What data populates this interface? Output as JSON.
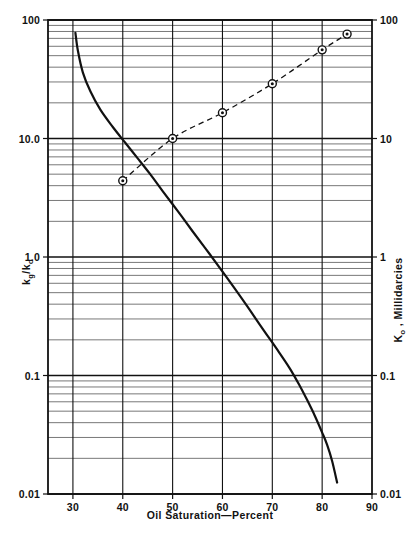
{
  "figure": {
    "background_color": "#ffffff",
    "ink_color": "#111111",
    "grid_color": "#555555"
  },
  "chart_data": {
    "type": "line",
    "title": "",
    "subtitle": "",
    "xlabel": "Oil Saturation—Percent",
    "ylabel_left": "kg/ko",
    "ylabel_left_parts": {
      "k1": "k",
      "sub1": "g",
      "slash": "/",
      "k2": "k",
      "sub2": "o"
    },
    "ylabel_right": "Ko , Millidarcies",
    "ylabel_right_parts": {
      "k": "K",
      "sub": "o",
      "rest": " , Millidarcies"
    },
    "xlim": [
      25,
      90
    ],
    "ylim": [
      0.01,
      100
    ],
    "xscale": "linear",
    "yscale": "log",
    "grid": true,
    "grid_style": "log-minor-horizontal + major-vertical",
    "legend": "none",
    "x_ticks": [
      30,
      40,
      50,
      60,
      70,
      80,
      90
    ],
    "x_tick_labels": [
      "30",
      "40",
      "50",
      "60",
      "70",
      "80",
      "90"
    ],
    "y_ticks_left": [
      100,
      10,
      1,
      0.1,
      0.01
    ],
    "y_tick_labels_left": [
      "100",
      "10.0",
      "1.0",
      "0.1",
      "0.01"
    ],
    "y_ticks_right": [
      100,
      10,
      1,
      0.1,
      0.01
    ],
    "y_tick_labels_right": [
      "100",
      "10",
      "1",
      "0.1",
      "0.01"
    ],
    "series": [
      {
        "name": "kg/ko relative permeability ratio",
        "axis": "left",
        "style": "solid",
        "marker": "none",
        "linewidth": 2.2,
        "color": "#111111",
        "x": [
          30.5,
          31.0,
          32.0,
          33.5,
          35.5,
          38.0,
          40.5,
          43.0,
          45.5,
          48.0,
          51.0,
          54.0,
          57.5,
          61.0,
          64.5,
          68.0,
          71.0,
          73.5,
          75.5,
          77.0,
          78.5,
          80.0,
          81.0,
          82.0,
          83.0
        ],
        "y": [
          78.0,
          55.0,
          36.0,
          25.0,
          17.5,
          12.5,
          9.2,
          6.8,
          5.0,
          3.6,
          2.45,
          1.65,
          1.05,
          0.66,
          0.41,
          0.25,
          0.165,
          0.115,
          0.082,
          0.062,
          0.046,
          0.033,
          0.026,
          0.019,
          0.0125
        ]
      },
      {
        "name": "Ko, millidarcies",
        "axis": "right",
        "style": "dashed",
        "marker": "circle-dot",
        "linewidth": 1.3,
        "color": "#111111",
        "x": [
          40,
          50,
          60,
          70,
          80,
          85
        ],
        "y": [
          4.4,
          10.0,
          16.5,
          29.0,
          56.0,
          76.0
        ]
      }
    ],
    "annotations": []
  },
  "axes_geometry": {
    "left_px": 48,
    "right_px": 372,
    "top_px": 20,
    "bottom_px": 494
  }
}
